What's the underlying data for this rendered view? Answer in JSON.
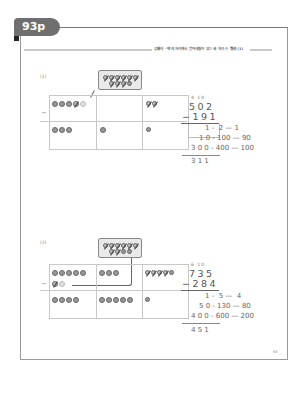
{
  "page": {
    "tab_label": "93p",
    "header_text": "공통자 · 백의 자리에서 받아내림이 있는 세 자리 수 뺄셈 (1)",
    "page_number": "93"
  },
  "problems": [
    {
      "label": "(1)",
      "carry_marks": "4 10",
      "minuend": "502",
      "minuend_struck_digit": "5",
      "subtrahend": "191",
      "operator": "−",
      "expansion": [
        {
          "result": "1",
          "row": "1 - 2 - 1"
        },
        {
          "result": "10",
          "row": "10 - 100 - 90"
        },
        {
          "result": "300",
          "row": "300 - 400 - 100"
        }
      ],
      "expansion_display": [
        "1 -  2 — 1",
        "1 0 - 100 — 90",
        "3 0 0 - 400 — 100"
      ],
      "answer": "311",
      "answer_display": "3 1 1",
      "table": {
        "top_row": {
          "hundreds_coins": 5,
          "hundreds_crossed": 1,
          "tens_coins": 0,
          "ones_coins": 2,
          "ones_crossed": 1
        },
        "regroup_box_coins": 10,
        "bottom_row": {
          "hundreds_coins": 3,
          "tens_coins": 1,
          "ones_coins": 1
        }
      }
    },
    {
      "label": "(2)",
      "carry_marks": "6 10",
      "minuend": "735",
      "minuend_struck_digit": "7",
      "subtrahend": "284",
      "operator": "−",
      "expansion": [
        {
          "result": "1",
          "row": "1 - 5 - 4"
        },
        {
          "result": "50",
          "row": "50 - 130 - 80"
        },
        {
          "result": "400",
          "row": "400 - 600 - 200"
        }
      ],
      "expansion_display": [
        "1 -  5 —  4",
        "5 0 - 130 — 80",
        "4 0 0 - 600 — 200"
      ],
      "answer": "451",
      "answer_display": "4 5 1",
      "table": {
        "top_row": {
          "hundreds_coins": 7,
          "hundreds_crossed": 1,
          "tens_coins": 3,
          "ones_coins": 5,
          "ones_crossed": 4
        },
        "regroup_box_coins": 10,
        "bottom_row": {
          "hundreds_coins": 4,
          "tens_coins": 5,
          "ones_coins": 1
        }
      }
    }
  ]
}
